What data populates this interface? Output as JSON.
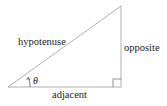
{
  "diagram": {
    "type": "right-triangle",
    "labels": {
      "hypotenuse": "hypotenuse",
      "opposite": "opposite",
      "adjacent": "adjacent",
      "angle": "θ"
    },
    "colors": {
      "line": "#999999",
      "text": "#222222",
      "background": "#ffffff"
    }
  }
}
